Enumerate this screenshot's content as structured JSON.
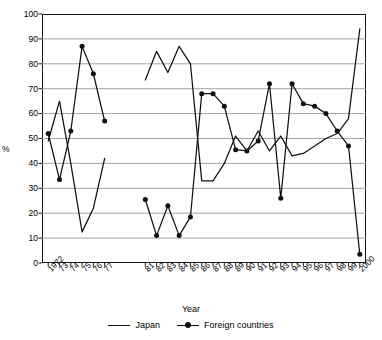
{
  "chart_data": {
    "type": "line",
    "title": "",
    "xlabel": "Year",
    "ylabel": "%",
    "ylim": [
      0,
      100
    ],
    "ytick_step": 10,
    "yticks": [
      0,
      10,
      20,
      30,
      40,
      50,
      60,
      70,
      80,
      90,
      100
    ],
    "grid": "horizontal",
    "legend_position": "bottom-center",
    "categories": [
      "1972",
      "73",
      "74",
      "75",
      "76",
      "77",
      "81",
      "82",
      "83",
      "84",
      "85",
      "86",
      "87",
      "88",
      "89",
      "90",
      "91",
      "92",
      "93",
      "94",
      "95",
      "96",
      "97",
      "98",
      "99",
      "2000"
    ],
    "series": [
      {
        "name": "Japan",
        "marker": "none",
        "values": [
          49,
          65,
          40,
          12.5,
          22,
          42,
          73.5,
          85,
          76.5,
          87,
          80,
          33,
          33,
          40,
          51,
          45,
          53,
          45,
          51,
          43,
          44,
          47,
          50,
          52,
          58,
          94
        ]
      },
      {
        "name": "Foreign countries",
        "marker": "filled-circle",
        "values": [
          52,
          33.5,
          53,
          87,
          76,
          57,
          25.5,
          11,
          23,
          11,
          18.5,
          68,
          68,
          63,
          45.5,
          45,
          49,
          72,
          26,
          72,
          64,
          63,
          60,
          53,
          47,
          3.5
        ]
      }
    ],
    "legend": [
      "Japan",
      "Foreign countries"
    ],
    "colors": {
      "line": "#111111",
      "grid": "#9a9a9a",
      "frame": "#1a1a1a"
    }
  }
}
